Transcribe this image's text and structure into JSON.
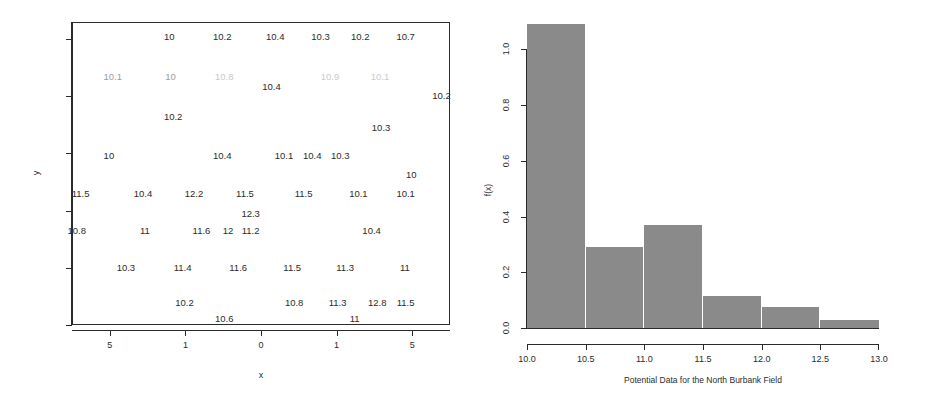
{
  "chart_data": [
    {
      "type": "scatter",
      "id": "value-posting-map",
      "title": "",
      "xlabel": "x",
      "ylabel": "y",
      "grid": false,
      "legend": null,
      "xlim": [
        -17.5,
        7.5
      ],
      "ylim": [
        0,
        10.6
      ],
      "xticklabels": [
        "5",
        "1",
        "0",
        "1",
        "5"
      ],
      "xtickvalues": [
        -15,
        -10,
        -5,
        0,
        5
      ],
      "yticklabels": [
        "0",
        "2",
        "4",
        "6",
        "8",
        "10"
      ],
      "ytickvalues": [
        0,
        2,
        4,
        6,
        8,
        10
      ],
      "note": "Data values rendered as text labels at their (x,y) map locations; some labels are faded/washed-out in the scan.",
      "points": [
        {
          "label": "10",
          "x": 0.255,
          "y": 0.955,
          "fade": "none"
        },
        {
          "label": "10.2",
          "x": 0.395,
          "y": 0.955,
          "fade": "none"
        },
        {
          "label": "10.4",
          "x": 0.535,
          "y": 0.955,
          "fade": "none"
        },
        {
          "label": "10.3",
          "x": 0.655,
          "y": 0.955,
          "fade": "none"
        },
        {
          "label": "10.2",
          "x": 0.76,
          "y": 0.955,
          "fade": "none"
        },
        {
          "label": "10.7",
          "x": 0.88,
          "y": 0.955,
          "fade": "none"
        },
        {
          "label": "10.1",
          "x": 0.105,
          "y": 0.822,
          "fade": "semi"
        },
        {
          "label": "10",
          "x": 0.258,
          "y": 0.822,
          "fade": "semi"
        },
        {
          "label": "10.8",
          "x": 0.4,
          "y": 0.822,
          "fade": "heavy"
        },
        {
          "label": "10.4",
          "x": 0.525,
          "y": 0.79,
          "fade": "none"
        },
        {
          "label": "10.9",
          "x": 0.68,
          "y": 0.822,
          "fade": "heavy"
        },
        {
          "label": "10.1",
          "x": 0.812,
          "y": 0.822,
          "fade": "heavy"
        },
        {
          "label": "10.2",
          "x": 0.975,
          "y": 0.76,
          "fade": "none"
        },
        {
          "label": "10.2",
          "x": 0.265,
          "y": 0.69,
          "fade": "none"
        },
        {
          "label": "10.3",
          "x": 0.815,
          "y": 0.655,
          "fade": "none"
        },
        {
          "label": "10",
          "x": 0.095,
          "y": 0.56,
          "fade": "none"
        },
        {
          "label": "10.4",
          "x": 0.395,
          "y": 0.56,
          "fade": "none"
        },
        {
          "label": "10.1",
          "x": 0.558,
          "y": 0.56,
          "fade": "none"
        },
        {
          "label": "10.4",
          "x": 0.633,
          "y": 0.56,
          "fade": "none"
        },
        {
          "label": "10.3",
          "x": 0.707,
          "y": 0.56,
          "fade": "none"
        },
        {
          "label": "10",
          "x": 0.895,
          "y": 0.5,
          "fade": "none"
        },
        {
          "label": "11.5",
          "x": 0.02,
          "y": 0.435,
          "fade": "none"
        },
        {
          "label": "10.4",
          "x": 0.185,
          "y": 0.435,
          "fade": "none"
        },
        {
          "label": "12.2",
          "x": 0.32,
          "y": 0.435,
          "fade": "none"
        },
        {
          "label": "11.5",
          "x": 0.455,
          "y": 0.435,
          "fade": "none"
        },
        {
          "label": "11.5",
          "x": 0.61,
          "y": 0.435,
          "fade": "none"
        },
        {
          "label": "10.1",
          "x": 0.755,
          "y": 0.435,
          "fade": "none"
        },
        {
          "label": "10.1",
          "x": 0.88,
          "y": 0.435,
          "fade": "none"
        },
        {
          "label": "12.3",
          "x": 0.47,
          "y": 0.368,
          "fade": "none"
        },
        {
          "label": "10.8",
          "x": 0.01,
          "y": 0.315,
          "fade": "none"
        },
        {
          "label": "11",
          "x": 0.19,
          "y": 0.315,
          "fade": "none"
        },
        {
          "label": "11.6",
          "x": 0.34,
          "y": 0.315,
          "fade": "none"
        },
        {
          "label": "12",
          "x": 0.41,
          "y": 0.315,
          "fade": "none"
        },
        {
          "label": "11.2",
          "x": 0.47,
          "y": 0.315,
          "fade": "none"
        },
        {
          "label": "10.4",
          "x": 0.79,
          "y": 0.315,
          "fade": "none"
        },
        {
          "label": "10.3",
          "x": 0.14,
          "y": 0.19,
          "fade": "none"
        },
        {
          "label": "11.4",
          "x": 0.29,
          "y": 0.19,
          "fade": "none"
        },
        {
          "label": "11.6",
          "x": 0.437,
          "y": 0.19,
          "fade": "none"
        },
        {
          "label": "11.5",
          "x": 0.58,
          "y": 0.19,
          "fade": "none"
        },
        {
          "label": "11.3",
          "x": 0.72,
          "y": 0.19,
          "fade": "none"
        },
        {
          "label": "11",
          "x": 0.878,
          "y": 0.19,
          "fade": "none"
        },
        {
          "label": "10.2",
          "x": 0.295,
          "y": 0.075,
          "fade": "none"
        },
        {
          "label": "10.8",
          "x": 0.585,
          "y": 0.075,
          "fade": "none"
        },
        {
          "label": "11.3",
          "x": 0.7,
          "y": 0.075,
          "fade": "none"
        },
        {
          "label": "12.8",
          "x": 0.805,
          "y": 0.075,
          "fade": "none"
        },
        {
          "label": "11.5",
          "x": 0.88,
          "y": 0.075,
          "fade": "none"
        },
        {
          "label": "10.6",
          "x": 0.4,
          "y": 0.022,
          "fade": "none"
        },
        {
          "label": "11",
          "x": 0.745,
          "y": 0.022,
          "fade": "none"
        }
      ]
    },
    {
      "type": "bar",
      "id": "histogram",
      "title": "",
      "xlabel": "Potential Data for the North Burbank Field",
      "ylabel": "f(x)",
      "grid": false,
      "legend": null,
      "bar_color": "#8a8a8a",
      "bin_edges": [
        10.0,
        10.5,
        11.0,
        11.5,
        12.0,
        12.5,
        13.0
      ],
      "categories": [
        "10.0-10.5",
        "10.5-11.0",
        "11.0-11.5",
        "11.5-12.0",
        "12.0-12.5",
        "12.5-13.0"
      ],
      "values": [
        1.09,
        0.29,
        0.37,
        0.115,
        0.075,
        0.03
      ],
      "xlim": [
        10.0,
        13.0
      ],
      "ylim": [
        0.0,
        1.12
      ],
      "xticklabels": [
        "10.0",
        "10.5",
        "11.0",
        "11.5",
        "12.0",
        "12.5",
        "13.0"
      ],
      "yticklabels": [
        "0.0",
        "0.2",
        "0.4",
        "0.6",
        "0.8",
        "1.0"
      ],
      "ytickvalues": [
        0.0,
        0.2,
        0.4,
        0.6,
        0.8,
        1.0
      ]
    }
  ]
}
